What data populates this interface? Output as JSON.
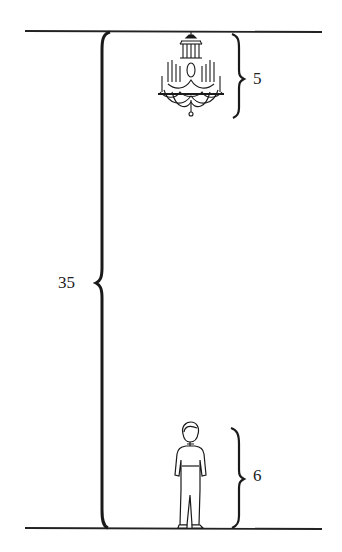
{
  "diagram": {
    "type": "height-comparison",
    "ceiling_line": {
      "y": 31
    },
    "floor_line": {
      "y": 528
    },
    "total_height": {
      "label": "35"
    },
    "chandelier": {
      "label": "5"
    },
    "person": {
      "label": "6"
    },
    "colors": {
      "ink": "#222222",
      "background": "#ffffff"
    }
  }
}
